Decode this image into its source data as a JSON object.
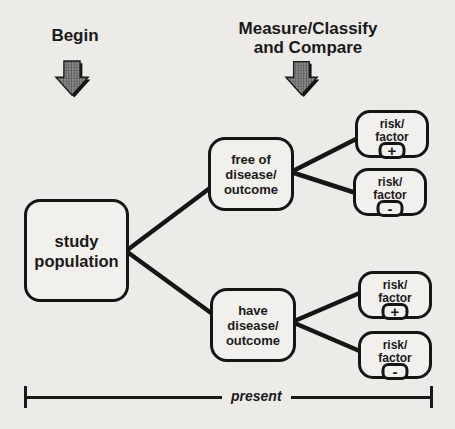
{
  "colors": {
    "paper": "#edebe8",
    "ink": "#1a1a1a",
    "arrow_fill": "#8f8f8f"
  },
  "stage_labels": {
    "begin": "Begin",
    "measure_line1": "Measure/Classify",
    "measure_line2": "and Compare"
  },
  "icons": {
    "begin_arrow": "down-arrow",
    "measure_arrow": "down-arrow"
  },
  "nodes": {
    "study_population": {
      "line1": "study",
      "line2": "population"
    },
    "free_of_disease": {
      "line1": "free of",
      "line2": "disease/",
      "line3": "outcome"
    },
    "have_disease": {
      "line1": "have",
      "line2": "disease/",
      "line3": "outcome"
    },
    "risk_factor_positive_top": {
      "line1": "risk/",
      "line2": "factor",
      "sign": "+"
    },
    "risk_factor_negative_top": {
      "line1": "risk/",
      "line2": "factor",
      "sign": "-"
    },
    "risk_factor_positive_bottom": {
      "line1": "risk/",
      "line2": "factor",
      "sign": "+"
    },
    "risk_factor_negative_bottom": {
      "line1": "risk/",
      "line2": "factor",
      "sign": "-"
    }
  },
  "edges": [
    {
      "from": "study_population",
      "to": "free_of_disease"
    },
    {
      "from": "study_population",
      "to": "have_disease"
    },
    {
      "from": "free_of_disease",
      "to": "risk_factor_positive_top"
    },
    {
      "from": "free_of_disease",
      "to": "risk_factor_negative_top"
    },
    {
      "from": "have_disease",
      "to": "risk_factor_positive_bottom"
    },
    {
      "from": "have_disease",
      "to": "risk_factor_negative_bottom"
    }
  ],
  "timeline": {
    "label": "present"
  }
}
